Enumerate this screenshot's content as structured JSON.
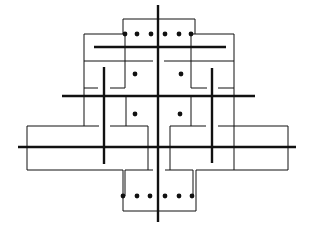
{
  "diagram": {
    "width": 313,
    "height": 240,
    "background": "#ffffff",
    "stroke_color": "#111111",
    "thick_width": 2.4,
    "thin_width": 1.0,
    "dot_radius": 2.4,
    "thick_lines": [
      {
        "name": "central-axis",
        "x1": 158,
        "y1": 5,
        "x2": 158,
        "y2": 222
      },
      {
        "name": "top-bar",
        "x1": 94,
        "y1": 47,
        "x2": 226,
        "y2": 47
      },
      {
        "name": "upper-bar",
        "x1": 62,
        "y1": 96,
        "x2": 255,
        "y2": 96
      },
      {
        "name": "lower-bar",
        "x1": 18,
        "y1": 147,
        "x2": 296,
        "y2": 147
      },
      {
        "name": "left-post",
        "x1": 104,
        "y1": 67,
        "x2": 104,
        "y2": 164
      },
      {
        "name": "right-post",
        "x1": 212,
        "y1": 68,
        "x2": 212,
        "y2": 163
      }
    ],
    "thin_paths": [
      {
        "name": "top-box",
        "d": "M123 34 L123 19 L195 19 L195 34"
      },
      {
        "name": "left-upper-frame",
        "d": "M123 34 L84 34 L84 126"
      },
      {
        "name": "right-upper-frame",
        "d": "M193 34 L234 34 L234 170"
      },
      {
        "name": "left-inner-stem",
        "d": "M125 34 L125 88"
      },
      {
        "name": "right-inner-stem",
        "d": "M191 34 L191 88"
      },
      {
        "name": "left-mid-line",
        "d": "M84 61 L153 61"
      },
      {
        "name": "right-mid-line",
        "d": "M164 61 L234 61"
      },
      {
        "name": "left-tick-a",
        "d": "M84 88 L98 88"
      },
      {
        "name": "left-tick-b",
        "d": "M110 88 L125 88"
      },
      {
        "name": "right-tick-a",
        "d": "M191 88 L207 88"
      },
      {
        "name": "right-tick-b",
        "d": "M218 88 L234 88"
      },
      {
        "name": "left-center-stem",
        "d": "M126 96 L126 126 L148 126 L148 170"
      },
      {
        "name": "right-center-stem",
        "d": "M191 96 L191 126 L170 126 L170 170"
      },
      {
        "name": "left-lower-box-a",
        "d": "M27 170 L27 126 L99 126"
      },
      {
        "name": "left-lower-box-b",
        "d": "M110 126 L126 126"
      },
      {
        "name": "right-lower-box-a",
        "d": "M218 126 L288 126 L288 170"
      },
      {
        "name": "right-lower-box-b",
        "d": "M191 126 L206 126"
      },
      {
        "name": "left-bottom-line",
        "d": "M27 170 L123 170 L123 196"
      },
      {
        "name": "left-bottom-line-b",
        "d": "M125 196 L125 170 L153 170"
      },
      {
        "name": "right-bottom-line",
        "d": "M165 170 L193 170 L193 196"
      },
      {
        "name": "right-bottom-line-b",
        "d": "M196 196 L196 170 L288 170"
      },
      {
        "name": "bottom-box",
        "d": "M123 196 L123 211 L196 211 L196 196"
      }
    ],
    "dots": [
      {
        "name": "top-dot-1",
        "cx": 125,
        "cy": 34
      },
      {
        "name": "top-dot-2",
        "cx": 137,
        "cy": 34
      },
      {
        "name": "top-dot-3",
        "cx": 151,
        "cy": 34
      },
      {
        "name": "top-dot-4",
        "cx": 165,
        "cy": 34
      },
      {
        "name": "top-dot-5",
        "cx": 179,
        "cy": 34
      },
      {
        "name": "top-dot-6",
        "cx": 191,
        "cy": 34
      },
      {
        "name": "upper-left-dot",
        "cx": 135,
        "cy": 74
      },
      {
        "name": "upper-right-dot",
        "cx": 181,
        "cy": 74
      },
      {
        "name": "lower-left-dot",
        "cx": 135,
        "cy": 114
      },
      {
        "name": "lower-right-dot",
        "cx": 180,
        "cy": 114
      },
      {
        "name": "bottom-dot-1",
        "cx": 123,
        "cy": 196
      },
      {
        "name": "bottom-dot-2",
        "cx": 137,
        "cy": 196
      },
      {
        "name": "bottom-dot-3",
        "cx": 150,
        "cy": 196
      },
      {
        "name": "bottom-dot-4",
        "cx": 165,
        "cy": 196
      },
      {
        "name": "bottom-dot-5",
        "cx": 179,
        "cy": 196
      },
      {
        "name": "bottom-dot-6",
        "cx": 192,
        "cy": 196
      }
    ]
  }
}
